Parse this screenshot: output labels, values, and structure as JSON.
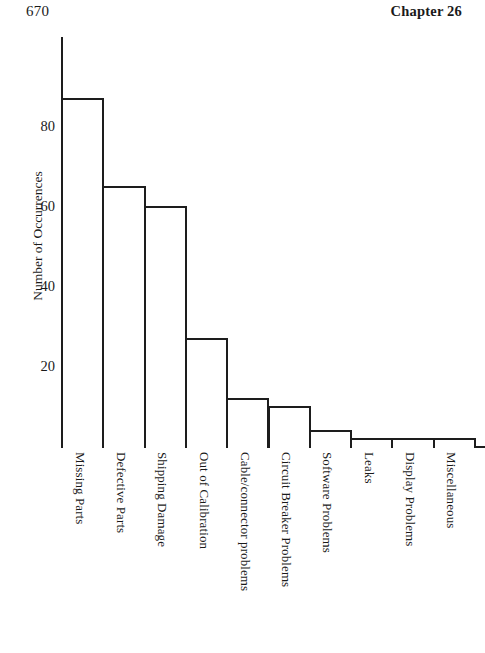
{
  "header": {
    "page_number": "670",
    "chapter": "Chapter 26"
  },
  "chart_data": {
    "type": "bar",
    "title": "",
    "xlabel": "",
    "ylabel": "Number of Occurrences",
    "ylim": [
      0,
      102
    ],
    "grid": false,
    "legend": null,
    "ytick_labels": [
      "20",
      "40",
      "60",
      "80"
    ],
    "ytick_values": [
      20,
      40,
      60,
      80
    ],
    "categories": [
      "Missing Parts",
      "Defective Parts",
      "Shipping Damage",
      "Out of Calibration",
      "Cable/connector problems",
      "Circuit Breaker Problems",
      "Software Problems",
      "Leaks",
      "Display Problems",
      "Miscellaneous"
    ],
    "values": [
      87,
      65,
      60,
      27,
      12,
      10,
      4,
      2,
      2,
      2
    ]
  }
}
